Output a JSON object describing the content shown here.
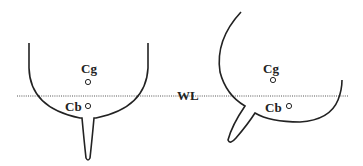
{
  "diagram": {
    "waterline_label": "WL",
    "upright_hull": {
      "center_of_gravity_label": "Cg",
      "center_of_buoyancy_label": "Cb"
    },
    "heeled_hull": {
      "center_of_gravity_label": "Cg",
      "center_of_buoyancy_label": "Cb"
    },
    "colors": {
      "stroke": "#222222",
      "waterline": "#555555",
      "background": "#ffffff"
    }
  }
}
